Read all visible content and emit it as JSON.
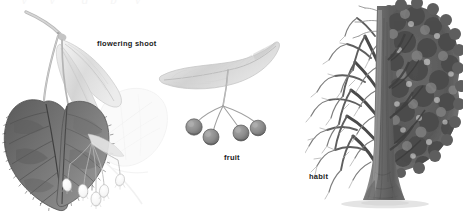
{
  "plate": {
    "subject": "Tilia (linden / lime tree)",
    "background_color": "#ffffff",
    "clipped_top_text": "descenders of a clipped caption line",
    "medium": "graphite pencil botanical illustration, greyscale"
  },
  "labels": {
    "flowering_shoot": "flowering shoot",
    "fruit": "fruit",
    "habit": "habit"
  },
  "panels": [
    {
      "name": "flowering-shoot",
      "label": "flowering shoot",
      "label_position": {
        "x": 97,
        "y": 39
      },
      "bounds": {
        "x": 0,
        "y": 4,
        "width": 175,
        "height": 210
      },
      "parts": [
        "woody twig",
        "two dark heart-shaped serrated leaves",
        "pale strap-shaped floral bract",
        "pendant cyme of white five-petalled flowers",
        "ghosted pale background leaf"
      ]
    },
    {
      "name": "fruit",
      "label": "fruit",
      "label_position": {
        "x": 224,
        "y": 153
      },
      "bounds": {
        "x": 155,
        "y": 40,
        "width": 145,
        "height": 135
      },
      "parts": [
        "pale strap-shaped winged bract",
        "slender peduncle",
        "four round grey nutlets"
      ],
      "nutlet_count": 4
    },
    {
      "name": "habit",
      "label": "habit",
      "label_position": {
        "x": 309,
        "y": 172
      },
      "bounds": {
        "x": 305,
        "y": 0,
        "width": 158,
        "height": 214
      },
      "parts": [
        "single straight trunk",
        "left half drawn bare as winter branching",
        "right half drawn in full dense summer foliage",
        "ground shadow at base"
      ],
      "split_rendering": "winter-left / summer-right"
    }
  ],
  "colors": {
    "page_background": "#ffffff",
    "label_text": "#1b1b1b",
    "leaf_dark": "#6e6e6e",
    "leaf_darkest": "#4f4f4f",
    "leaf_mid": "#8a8a8a",
    "bract_pale": "#dcdcdc",
    "bract_paler": "#efefef",
    "ghost_leaf": "#f2f2f2",
    "flower_white": "#fdfdfd",
    "flower_outline": "#b4b4b4",
    "stem": "#9a9a9a",
    "nutlet": "#8d8d8d",
    "nutlet_shadow": "#636363",
    "branch_dark": "#3f3f3f",
    "branch_light": "#9d9d9d",
    "trunk": "#7a7a7a",
    "foliage_dark": "#555555",
    "foliage_mid": "#777777",
    "foliage_light": "#a6a6a6",
    "ground_shadow": "#e2e2e2"
  }
}
